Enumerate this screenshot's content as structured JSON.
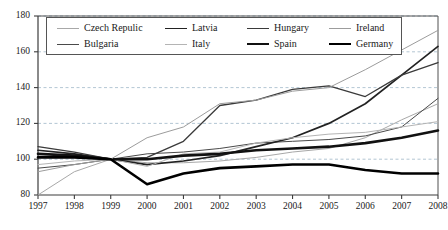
{
  "chart_data": {
    "type": "line",
    "title": "",
    "xlabel": "",
    "ylabel": "",
    "x": [
      1997,
      1998,
      1999,
      2000,
      2001,
      2002,
      2003,
      2004,
      2005,
      2006,
      2007,
      2008
    ],
    "xlim": [
      1997,
      2008
    ],
    "ylim": [
      80,
      180
    ],
    "yticks": [
      80,
      100,
      120,
      140,
      160,
      180
    ],
    "xticks": [
      "1997",
      "1998",
      "1999",
      "2000",
      "2001",
      "2002",
      "2003",
      "2004",
      "2005",
      "2006",
      "2007",
      "2008"
    ],
    "grid": "horizontal-dashed",
    "legend_position": "top-inside",
    "series": [
      {
        "name": "Czech Repulic",
        "color": "#a8a8a8",
        "width": 1.0,
        "values": [
          80,
          93,
          100,
          98,
          98,
          99,
          101,
          104,
          106,
          112,
          122,
          131
        ]
      },
      {
        "name": "Bulgaria",
        "color": "#4a4a4a",
        "width": 1.0,
        "values": [
          95,
          97,
          100,
          103,
          104,
          106,
          109,
          110,
          111,
          113,
          118,
          134
        ]
      },
      {
        "name": "Latvia",
        "color": "#222222",
        "width": 1.7,
        "values": [
          105,
          103,
          100,
          97,
          99,
          102,
          107,
          112,
          120,
          131,
          147,
          163
        ]
      },
      {
        "name": "Italy",
        "color": "#b4b4b4",
        "width": 1.0,
        "values": [
          97,
          99,
          100,
          96,
          103,
          104,
          109,
          112,
          114,
          115,
          118,
          121
        ]
      },
      {
        "name": "Hungary",
        "color": "#3a3a3a",
        "width": 1.3,
        "values": [
          107,
          104,
          100,
          101,
          110,
          130,
          133,
          139,
          141,
          135,
          147,
          154
        ]
      },
      {
        "name": "Spain",
        "color": "#111111",
        "width": 2.6,
        "values": [
          103,
          102,
          100,
          100,
          102,
          103,
          105,
          106,
          107,
          109,
          112,
          116
        ]
      },
      {
        "name": "Ireland",
        "color": "#9c9c9c",
        "width": 1.0,
        "values": [
          93,
          97,
          100,
          112,
          118,
          131,
          133,
          138,
          140,
          150,
          161,
          172
        ]
      },
      {
        "name": "Germany",
        "color": "#000000",
        "width": 2.6,
        "values": [
          101,
          101,
          100,
          86,
          92,
          95,
          96,
          97,
          97,
          94,
          92,
          92
        ]
      }
    ]
  },
  "legend": {
    "rows": [
      [
        {
          "label": "Czech Repulic",
          "series": 0
        },
        {
          "label": "Latvia",
          "series": 2
        },
        {
          "label": "Hungary",
          "series": 4
        },
        {
          "label": "Ireland",
          "series": 6
        }
      ],
      [
        {
          "label": "Bulgaria",
          "series": 1
        },
        {
          "label": "Italy",
          "series": 3
        },
        {
          "label": "Spain",
          "series": 5
        },
        {
          "label": "Germany",
          "series": 7
        }
      ]
    ]
  },
  "caption": {
    "text": ""
  },
  "axis": {
    "color": "#3c3c3c",
    "grid_color": "#9fb8c8"
  }
}
